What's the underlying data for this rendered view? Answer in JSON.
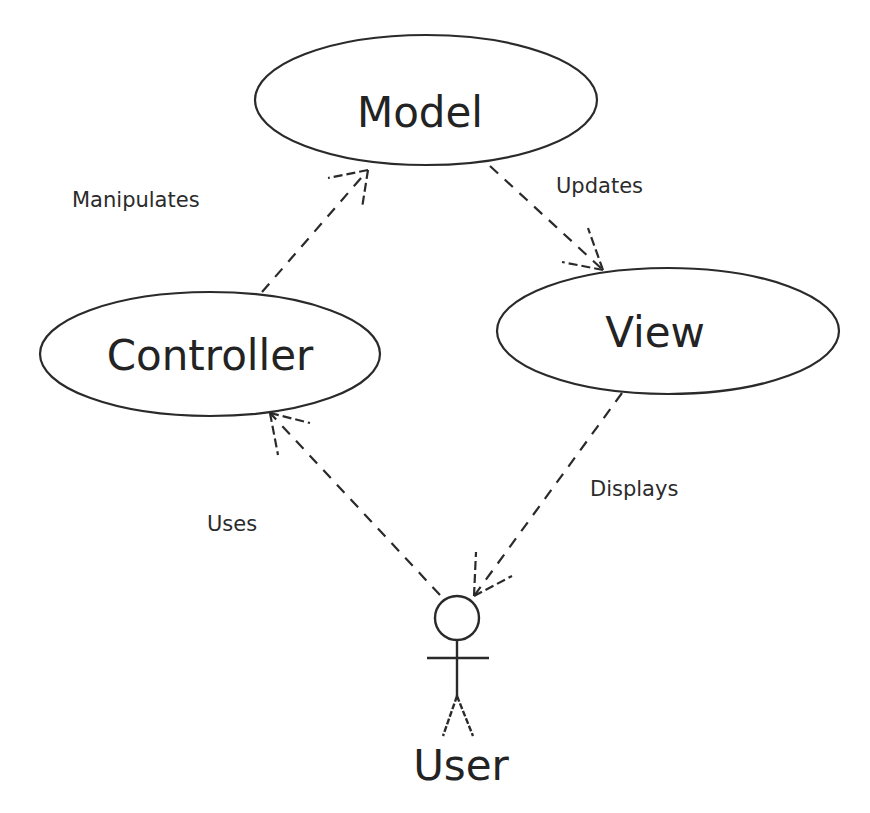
{
  "diagram": {
    "type": "uml-use-case",
    "colors": {
      "stroke": "#2a2a2a",
      "text": "#232323",
      "background": "#ffffff"
    },
    "nodes": {
      "model": {
        "label": "Model",
        "shape": "ellipse"
      },
      "controller": {
        "label": "Controller",
        "shape": "ellipse"
      },
      "view": {
        "label": "View",
        "shape": "ellipse"
      },
      "user": {
        "label": "User",
        "shape": "actor"
      }
    },
    "edges": {
      "manipulates": {
        "from": "controller",
        "to": "model",
        "label": "Manipulates",
        "style": "dashed-open-arrow"
      },
      "updates": {
        "from": "model",
        "to": "view",
        "label": "Updates",
        "style": "dashed-open-arrow"
      },
      "displays": {
        "from": "view",
        "to": "user",
        "label": "Displays",
        "style": "dashed-open-arrow"
      },
      "uses": {
        "from": "user",
        "to": "controller",
        "label": "Uses",
        "style": "dashed-open-arrow"
      }
    }
  }
}
